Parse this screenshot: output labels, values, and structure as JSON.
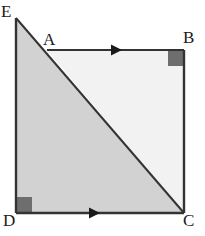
{
  "figure": {
    "kind": "geometry-diagram",
    "background_color": "#ffffff",
    "stroke_color": "#333333",
    "stroke_width": 2,
    "labels": [
      {
        "id": "E",
        "text": "E",
        "position": "top-left-outside"
      },
      {
        "id": "A",
        "text": "A",
        "position": "top-edge-left-inside"
      },
      {
        "id": "B",
        "text": "B",
        "position": "top-right-outside"
      },
      {
        "id": "C",
        "text": "C",
        "position": "bottom-right-outside"
      },
      {
        "id": "D",
        "text": "D",
        "position": "bottom-left-outside"
      }
    ],
    "vertices": {
      "E": {
        "x": 16,
        "y": 18
      },
      "A": {
        "x": 47,
        "y": 50
      },
      "B": {
        "x": 184,
        "y": 50
      },
      "C": {
        "x": 184,
        "y": 213
      },
      "D": {
        "x": 16,
        "y": 213
      }
    },
    "regions": [
      {
        "name": "lower-left-triangle",
        "fill": "#d2d2d2",
        "points": "16,18 16,213 184,213"
      },
      {
        "name": "upper-right-triangle",
        "fill": "#f2f2f2",
        "points": "47,50 184,50 184,213"
      }
    ],
    "segments": [
      {
        "name": "left-edge-ED",
        "from": "E",
        "to": "D",
        "arrow": false
      },
      {
        "name": "top-edge-AB",
        "from": "A",
        "to": "B",
        "arrow": true
      },
      {
        "name": "right-edge-BC",
        "from": "B",
        "to": "C",
        "arrow": false
      },
      {
        "name": "bottom-edge-DC",
        "from": "D",
        "to": "C",
        "arrow": true
      },
      {
        "name": "diagonal-EC",
        "from": "E",
        "to": "C",
        "arrow": false
      }
    ],
    "right_angle_markers": [
      {
        "name": "right-angle-at-B",
        "x": 167,
        "y": 50,
        "size": 15,
        "fill": "#6e6e6e"
      },
      {
        "name": "right-angle-at-D",
        "x": 16,
        "y": 198,
        "size": 15,
        "fill": "#6e6e6e"
      }
    ],
    "arrow_markers": [
      {
        "name": "arrow-on-AB",
        "x": 118,
        "y": 50,
        "direction": "right"
      },
      {
        "name": "arrow-on-DC",
        "x": 96,
        "y": 213,
        "direction": "right"
      }
    ]
  }
}
